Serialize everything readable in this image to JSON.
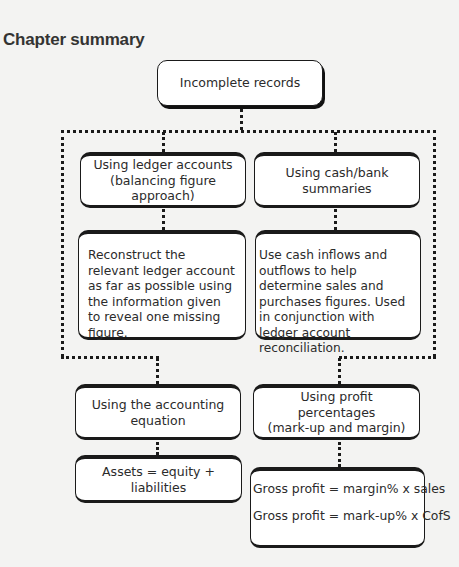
{
  "title": "Chapter summary",
  "diagram": {
    "root": {
      "label": "Incomplete records"
    },
    "methods": [
      {
        "heading_line1": "Using ledger accounts",
        "heading_line2": "(balancing figure approach)",
        "detail": "Reconstruct the relevant ledger account as far as possible using the information given to reveal one missing figure."
      },
      {
        "heading": "Using cash/bank summaries",
        "detail": "Use cash inflows and outflows to help determine sales and purchases figures. Used in conjunction with ledger account reconciliation."
      },
      {
        "heading_line1": "Using the accounting",
        "heading_line2": "equation",
        "detail": "Assets = equity + liabilities"
      },
      {
        "heading_line1": "Using profit percentages",
        "heading_line2": "(mark-up and margin)",
        "formulas": [
          "Gross profit = margin% x sales",
          "Gross profit = mark-up% x CofS"
        ]
      }
    ]
  },
  "colors": {
    "background": "#f3f3f2",
    "box_fill": "#ffffff",
    "box_border": "#1a1a1a",
    "text": "#2b2b2b"
  }
}
